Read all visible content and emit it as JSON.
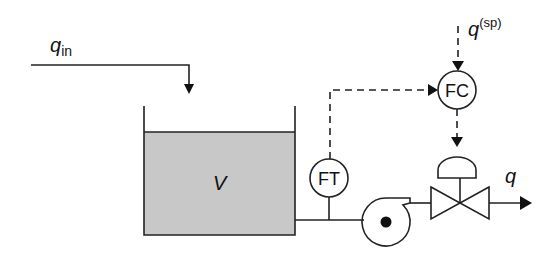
{
  "diagram": {
    "inflow": {
      "symbol": "q",
      "subscript": "in"
    },
    "tank": {
      "label": "V",
      "fill_color": "#c8c8c8"
    },
    "flow_transmitter": {
      "label": "FT"
    },
    "flow_controller": {
      "label": "FC"
    },
    "setpoint": {
      "symbol": "q",
      "superscript": "(sp)"
    },
    "outflow": {
      "symbol": "q"
    },
    "pump": {
      "name": "centrifugal pump"
    },
    "valve": {
      "name": "control valve"
    }
  }
}
